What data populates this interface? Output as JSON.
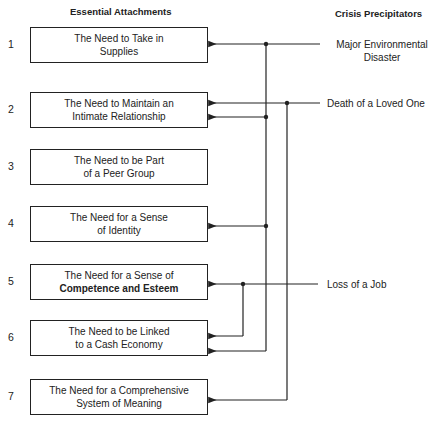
{
  "headers": {
    "left": "Essential Attachments",
    "right": "Crisis Precipitators"
  },
  "attachments": [
    {
      "number": "1",
      "line1": "The Need to Take in",
      "line2": "Supplies"
    },
    {
      "number": "2",
      "line1": "The Need to Maintain an",
      "line2": "Intimate Relationship"
    },
    {
      "number": "3",
      "line1": "The Need to be Part",
      "line2": "of a Peer Group"
    },
    {
      "number": "4",
      "line1": "The Need for a Sense",
      "line2": "of Identity"
    },
    {
      "number": "5",
      "line1": "The Need for a Sense of",
      "line2": "Competence and Esteem"
    },
    {
      "number": "6",
      "line1": "The Need to be Linked",
      "line2": "to a Cash Economy"
    },
    {
      "number": "7",
      "line1": "The Need for a Comprehensive",
      "line2": "System of Meaning"
    }
  ],
  "precipitators": [
    {
      "line1": "Major Environmental",
      "line2": "Disaster",
      "affects": [
        "1",
        "2",
        "4",
        "6"
      ]
    },
    {
      "line1": "Death of a Loved One",
      "line2": "",
      "affects": [
        "2",
        "7"
      ]
    },
    {
      "line1": "Loss of a Job",
      "line2": "",
      "affects": [
        "5",
        "6"
      ]
    }
  ],
  "colors": {
    "line": "#222222",
    "background": "#ffffff"
  }
}
